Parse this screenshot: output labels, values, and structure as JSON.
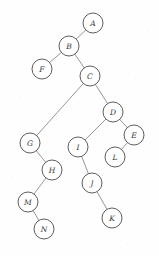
{
  "figure": {
    "title": "",
    "type": "tree-graph",
    "width": 159,
    "height": 256,
    "background_color": "#fefefe",
    "node_fill_color": "#ffffff",
    "node_stroke_color": "#5e5e5e",
    "edge_color": "#8a8a8a",
    "label_color": "#3a3a3a",
    "node_radius": 10
  },
  "nodes": [
    {
      "id": "A",
      "label": "A",
      "x": 93,
      "y": 23
    },
    {
      "id": "B",
      "label": "B",
      "x": 69,
      "y": 46
    },
    {
      "id": "F",
      "label": "F",
      "x": 42,
      "y": 69
    },
    {
      "id": "C",
      "label": "C",
      "x": 90,
      "y": 76
    },
    {
      "id": "D",
      "label": "D",
      "x": 113,
      "y": 112
    },
    {
      "id": "E",
      "label": "E",
      "x": 134,
      "y": 135
    },
    {
      "id": "G",
      "label": "G",
      "x": 30,
      "y": 143
    },
    {
      "id": "I",
      "label": "I",
      "x": 78,
      "y": 147
    },
    {
      "id": "L",
      "label": "L",
      "x": 115,
      "y": 157
    },
    {
      "id": "H",
      "label": "H",
      "x": 52,
      "y": 170
    },
    {
      "id": "J",
      "label": "J",
      "x": 92,
      "y": 183
    },
    {
      "id": "M",
      "label": "M",
      "x": 28,
      "y": 202
    },
    {
      "id": "K",
      "label": "K",
      "x": 112,
      "y": 218
    },
    {
      "id": "N",
      "label": "N",
      "x": 44,
      "y": 229
    }
  ],
  "edges": [
    {
      "from": "A",
      "to": "B"
    },
    {
      "from": "B",
      "to": "F"
    },
    {
      "from": "B",
      "to": "C"
    },
    {
      "from": "C",
      "to": "G"
    },
    {
      "from": "C",
      "to": "D"
    },
    {
      "from": "D",
      "to": "I"
    },
    {
      "from": "D",
      "to": "E"
    },
    {
      "from": "E",
      "to": "L"
    },
    {
      "from": "G",
      "to": "H"
    },
    {
      "from": "H",
      "to": "M"
    },
    {
      "from": "M",
      "to": "N"
    },
    {
      "from": "I",
      "to": "J"
    },
    {
      "from": "J",
      "to": "K"
    }
  ],
  "specks": [
    {
      "x": 6,
      "y": 14,
      "s": 1.2
    },
    {
      "x": 148,
      "y": 31,
      "s": 1.4
    },
    {
      "x": 150,
      "y": 35,
      "s": 1.0
    },
    {
      "x": 20,
      "y": 96,
      "s": 1.1
    },
    {
      "x": 135,
      "y": 78,
      "s": 1.0
    },
    {
      "x": 11,
      "y": 176,
      "s": 1.3
    },
    {
      "x": 146,
      "y": 197,
      "s": 1.1
    },
    {
      "x": 70,
      "y": 245,
      "s": 1.2
    },
    {
      "x": 127,
      "y": 243,
      "s": 1.0
    },
    {
      "x": 57,
      "y": 112,
      "s": 0.9
    }
  ]
}
